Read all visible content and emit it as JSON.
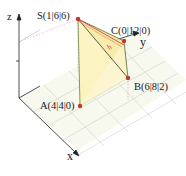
{
  "axes": {
    "x": "x",
    "y": "y",
    "z": "z"
  },
  "points": [
    {
      "id": "S",
      "label": "S(1|6|6)"
    },
    {
      "id": "C",
      "label": "C(0|12|0)"
    },
    {
      "id": "B",
      "label": "B(6|8|2)"
    },
    {
      "id": "A",
      "label": "A(4|4|0)"
    }
  ],
  "height_label": "h",
  "colors": {
    "point": "#c0392b",
    "face_fill": "#fbf5c0",
    "height_line": "#d0453a",
    "grid": "#cfcfcf",
    "axis": "#222222"
  }
}
